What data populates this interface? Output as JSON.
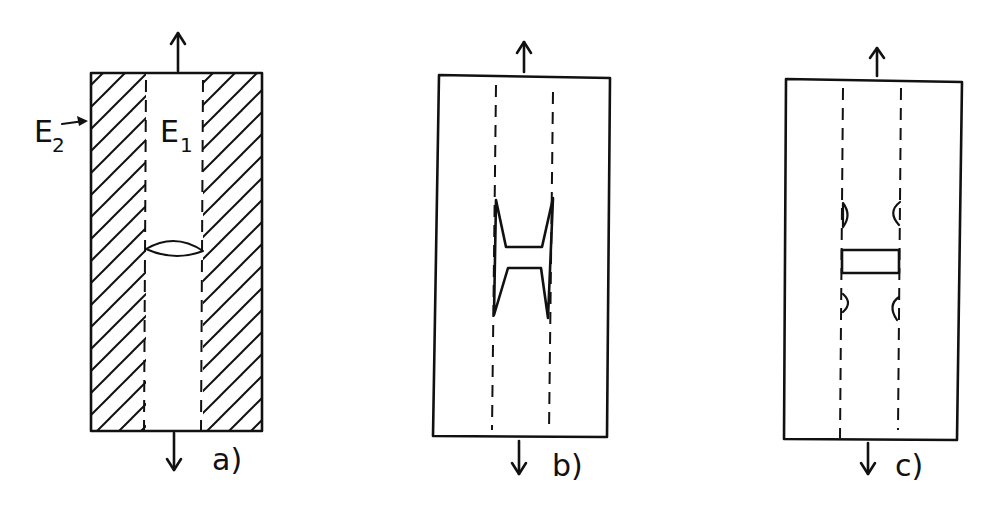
{
  "figure": {
    "panels": [
      {
        "id": "a",
        "label": "a)",
        "region_outer_label": "E",
        "region_outer_sub": "2",
        "region_inner_label": "E",
        "region_inner_sub": "1",
        "description": "hatched outer strips, central strip with lens-shaped crack"
      },
      {
        "id": "b",
        "label": "b)",
        "description": "H-shaped crack spanning dashed strip boundaries"
      },
      {
        "id": "c",
        "label": "c)",
        "description": "rectangular crack with semicircular flaws at strip boundaries"
      }
    ],
    "colors": {
      "ink": "#111111",
      "paper": "#ffffff"
    }
  }
}
